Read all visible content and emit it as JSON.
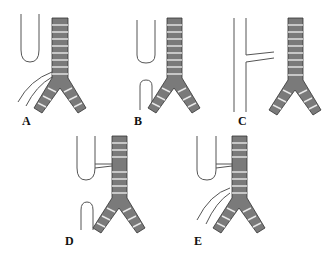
{
  "figure": {
    "colors": {
      "trachea_fill": "#7a7a7a",
      "ring_gap": "#e8e8e8",
      "outline": "#333333",
      "esophagus_line": "#555555",
      "background": "#ffffff"
    },
    "panels": [
      {
        "id": "A",
        "label": "A",
        "esophagus": "upper pouch",
        "fistula": "none",
        "lower": "curved lines from bifurcation"
      },
      {
        "id": "B",
        "label": "B",
        "esophagus": "upper pouch",
        "fistula": "none",
        "lower": "lower pouch"
      },
      {
        "id": "C",
        "label": "C",
        "esophagus": "continuous",
        "fistula": "H-type to trachea",
        "lower": "continuous"
      },
      {
        "id": "D",
        "label": "D",
        "esophagus": "upper pouch",
        "fistula": "upper pouch to trachea",
        "lower": "lower pouch"
      },
      {
        "id": "E",
        "label": "E",
        "esophagus": "upper pouch",
        "fistula": "upper pouch to trachea",
        "lower": "curved lines from bifurcation"
      }
    ]
  }
}
